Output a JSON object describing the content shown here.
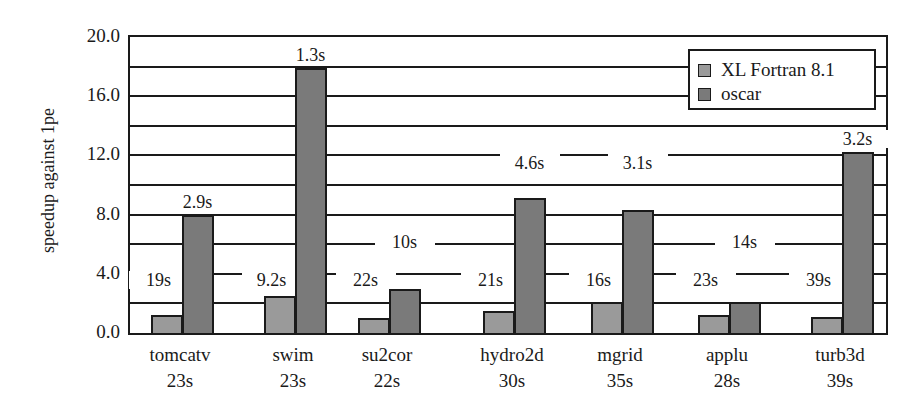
{
  "chart_data": {
    "type": "bar",
    "title": "",
    "xlabel": "",
    "ylabel": "speedup against 1pe",
    "ylim": [
      0,
      20
    ],
    "yticks": [
      "0.0",
      "4.0",
      "8.0",
      "12.0",
      "16.0",
      "20.0"
    ],
    "grid": true,
    "grid_step": 2.0,
    "legend_position": "top-right",
    "categories": [
      "tomcatv",
      "swim",
      "su2cor",
      "hydro2d",
      "mgrid",
      "applu",
      "turb3d"
    ],
    "category_sublabels": [
      "23s",
      "23s",
      "22s",
      "30s",
      "35s",
      "28s",
      "39s"
    ],
    "series": [
      {
        "name": "XL Fortran 8.1",
        "color": "#9a9a9a",
        "values": [
          1.2,
          2.5,
          1.0,
          1.5,
          2.1,
          1.2,
          1.1
        ],
        "annotations": [
          "19s",
          "9.2s",
          "22s",
          "21s",
          "16s",
          "23s",
          "39s"
        ]
      },
      {
        "name": "oscar",
        "color": "#7a7a7a",
        "values": [
          8.0,
          17.9,
          3.0,
          9.1,
          8.3,
          2.1,
          12.2
        ],
        "annotations": [
          "2.9s",
          "1.3s",
          "10s",
          "4.6s",
          "3.1s",
          "14s",
          "3.2s"
        ]
      }
    ]
  }
}
